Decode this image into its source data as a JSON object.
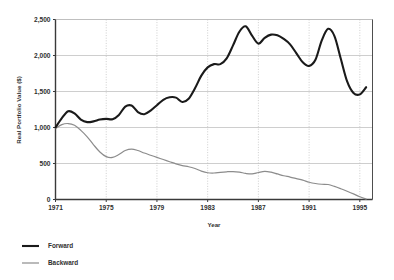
{
  "chart_data": {
    "type": "line",
    "title": "",
    "xlabel": "Year",
    "ylabel": "Real Portfolio Value ($)",
    "xlim": [
      1971,
      1996
    ],
    "ylim": [
      0,
      2500
    ],
    "grid": true,
    "legend_position": "below-left",
    "x_tick_labels": [
      "1971",
      "1975",
      "1979",
      "1983",
      "1987",
      "1991",
      "1995"
    ],
    "x_ticks": [
      1971,
      1975,
      1979,
      1983,
      1987,
      1991,
      1995
    ],
    "y_tick_labels": [
      "0",
      "500",
      "1,000",
      "1,500",
      "2,000",
      "2,500"
    ],
    "y_ticks": [
      0,
      500,
      1000,
      1500,
      2000,
      2500
    ],
    "x": [
      1971,
      1971.5,
      1972,
      1972.5,
      1973,
      1973.5,
      1974,
      1974.5,
      1975,
      1975.5,
      1976,
      1976.5,
      1977,
      1977.5,
      1978,
      1978.5,
      1979,
      1979.5,
      1980,
      1980.5,
      1981,
      1981.5,
      1982,
      1982.5,
      1983,
      1983.5,
      1984,
      1984.5,
      1985,
      1985.5,
      1986,
      1986.5,
      1987,
      1987.5,
      1988,
      1988.5,
      1989,
      1989.5,
      1990,
      1990.5,
      1991,
      1991.5,
      1992,
      1992.5,
      1993,
      1993.5,
      1994,
      1994.5,
      1995,
      1995.5
    ],
    "series": [
      {
        "name": "Forward",
        "color": "#1a1a1a",
        "line_width": 2.1,
        "values": [
          1000,
          1130,
          1225,
          1195,
          1110,
          1075,
          1085,
          1110,
          1120,
          1115,
          1175,
          1290,
          1305,
          1215,
          1185,
          1235,
          1310,
          1385,
          1420,
          1415,
          1355,
          1400,
          1545,
          1720,
          1835,
          1880,
          1880,
          1960,
          2140,
          2330,
          2405,
          2275,
          2165,
          2245,
          2290,
          2280,
          2230,
          2155,
          2030,
          1905,
          1855,
          1940,
          2210,
          2370,
          2270,
          1955,
          1640,
          1480,
          1460,
          1560
        ]
      },
      {
        "name": "Backward",
        "color": "#8c8c8c",
        "line_width": 1.2,
        "values": [
          985,
          1040,
          1055,
          1030,
          960,
          870,
          760,
          660,
          595,
          585,
          625,
          680,
          700,
          680,
          645,
          615,
          585,
          555,
          525,
          495,
          470,
          455,
          430,
          395,
          372,
          368,
          378,
          385,
          388,
          380,
          362,
          355,
          375,
          392,
          380,
          355,
          330,
          312,
          290,
          268,
          240,
          222,
          212,
          208,
          182,
          150,
          115,
          78,
          38,
          5
        ]
      }
    ]
  },
  "legend": {
    "items": [
      {
        "label": "Forward",
        "color": "#1a1a1a",
        "line_width": 2.1
      },
      {
        "label": "Backward",
        "color": "#8c8c8c",
        "line_width": 1.2
      }
    ]
  },
  "axes": {
    "y_title": "Real Portfolio Value ($)",
    "x_title": "Year",
    "y_labels": [
      "2,500",
      "2,000",
      "1,500",
      "1,000",
      "500",
      "0"
    ],
    "x_labels": [
      "1971",
      "1975",
      "1979",
      "1983",
      "1987",
      "1991",
      "1995"
    ]
  },
  "colors": {
    "background": "#ffffff",
    "axis": "#3a3a3a",
    "grid": "#b9b9b9",
    "forward": "#1a1a1a",
    "backward": "#8c8c8c",
    "text": "#2f2f2f"
  }
}
